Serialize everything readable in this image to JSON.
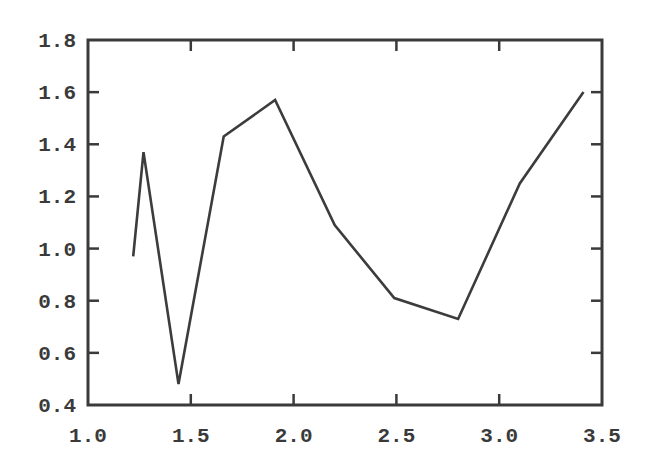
{
  "chart_data": {
    "type": "line",
    "title": "",
    "xlabel": "",
    "ylabel": "",
    "xlim": [
      1.0,
      3.5
    ],
    "ylim": [
      0.4,
      1.8
    ],
    "grid": false,
    "legend": null,
    "x_ticks": [
      "1.0",
      "1.5",
      "2.0",
      "2.5",
      "3.0",
      "3.5"
    ],
    "y_ticks": [
      "0.4",
      "0.6",
      "0.8",
      "1.0",
      "1.2",
      "1.4",
      "1.6",
      "1.8"
    ],
    "series": [
      {
        "name": "series-1",
        "color": "#3c3c3c",
        "x": [
          1.22,
          1.27,
          1.44,
          1.66,
          1.91,
          2.2,
          2.49,
          2.8,
          3.1,
          3.41
        ],
        "values": [
          0.97,
          1.37,
          0.48,
          1.43,
          1.57,
          1.09,
          0.81,
          0.73,
          1.25,
          1.6
        ]
      }
    ]
  }
}
